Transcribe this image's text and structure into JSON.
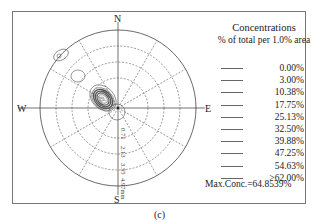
{
  "chart_data": {
    "type": "polar-contour",
    "title": "Concentrations",
    "subtitle": "% of total per 1.0% area",
    "directions": {
      "north": "N",
      "south": "S",
      "east": "E",
      "west": "W"
    },
    "radial_labels": [
      "0.71",
      "2.13",
      "3.55",
      "4.97mm"
    ],
    "legend": [
      "0.00%",
      "3.00%",
      "10.38%",
      "17.75%",
      "25.13%",
      "32.50%",
      "39.88%",
      "47.25%",
      "54.63%",
      ">62.00%"
    ],
    "max_conc": "Max.Conc.=64.8539%",
    "caption": "(c)"
  }
}
